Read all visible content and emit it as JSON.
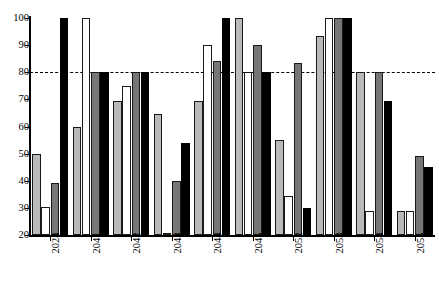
{
  "chart_data": {
    "type": "bar",
    "title": "",
    "subtitle": "",
    "xlabel": "",
    "ylabel": "",
    "categories": [
      "2024",
      "2041",
      "2042",
      "2043",
      "2044",
      "2045",
      "2052",
      "2053",
      "2054",
      "2055"
    ],
    "ylim": [
      20,
      100
    ],
    "yticks": [
      20,
      30,
      40,
      50,
      60,
      70,
      80,
      90,
      100
    ],
    "ytick_labels": [
      "20",
      "30",
      "40",
      "50",
      "60",
      "70",
      "80",
      "90",
      "100"
    ],
    "grid": false,
    "legend": "none",
    "reference_line": {
      "value": 80,
      "style": "dashed",
      "color": "#000000"
    },
    "series": [
      {
        "name": "series-1",
        "color": "#b9b9b9",
        "values": [
          50,
          60,
          69.5,
          64.5,
          69.5,
          100,
          55,
          93.5,
          80,
          29
        ]
      },
      {
        "name": "series-2",
        "color": "#ffffff",
        "values": [
          30.5,
          100,
          75,
          20.4,
          90,
          80,
          34.5,
          100,
          29,
          29
        ]
      },
      {
        "name": "series-3",
        "color": "#767676",
        "values": [
          39,
          80,
          80,
          40,
          84,
          90,
          83.5,
          100,
          80,
          49
        ]
      },
      {
        "name": "series-4",
        "color": "#000000",
        "values": [
          100,
          80,
          80,
          54,
          100,
          80,
          30,
          100,
          69.5,
          45
        ]
      }
    ]
  },
  "axis": {
    "y_axis_name": "y-axis",
    "x_axis_name": "x-axis"
  },
  "footer": {
    "text": ""
  }
}
